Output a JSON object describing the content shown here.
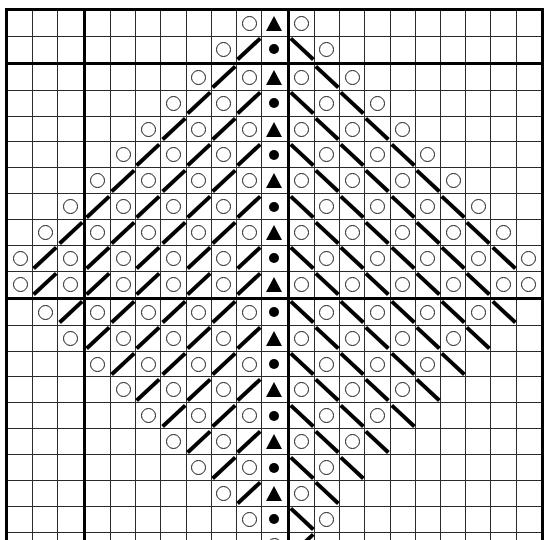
{
  "document": {
    "kind": "knitting-stitch-chart",
    "title": "Lace Chevron Stitch Chart",
    "rows": 21,
    "columns": 21,
    "colors": {
      "grid_line": "#2b2b2b",
      "heavy_grid_line": "#000000",
      "symbol": "#000000",
      "background": "#ffffff"
    },
    "heavy_column_boundaries": [
      3,
      11
    ],
    "heavy_row_boundaries": [
      2,
      11
    ],
    "symbol_key": {
      "O": "yarn-over-circle",
      "T": "centered-double-decrease-triangle",
      "D": "purl-dot",
      "R": "right-leaning-decrease-diagonal",
      "L": "left-leaning-decrease-diagonal",
      "-": "empty-cell"
    },
    "grid": [
      [
        "-",
        "-",
        "-",
        "-",
        "-",
        "-",
        "-",
        "-",
        "-",
        "O",
        "T",
        "O",
        "-",
        "-",
        "-",
        "-",
        "-",
        "-",
        "-",
        "-",
        "-"
      ],
      [
        "-",
        "-",
        "-",
        "-",
        "-",
        "-",
        "-",
        "-",
        "O",
        "R",
        "D",
        "L",
        "O",
        "-",
        "-",
        "-",
        "-",
        "-",
        "-",
        "-",
        "-"
      ],
      [
        "-",
        "-",
        "-",
        "-",
        "-",
        "-",
        "-",
        "O",
        "R",
        "O",
        "T",
        "O",
        "L",
        "O",
        "-",
        "-",
        "-",
        "-",
        "-",
        "-",
        "-"
      ],
      [
        "-",
        "-",
        "-",
        "-",
        "-",
        "-",
        "O",
        "R",
        "O",
        "R",
        "D",
        "L",
        "O",
        "L",
        "O",
        "-",
        "-",
        "-",
        "-",
        "-",
        "-"
      ],
      [
        "-",
        "-",
        "-",
        "-",
        "-",
        "O",
        "R",
        "O",
        "R",
        "O",
        "T",
        "O",
        "L",
        "O",
        "L",
        "O",
        "-",
        "-",
        "-",
        "-",
        "-"
      ],
      [
        "-",
        "-",
        "-",
        "-",
        "O",
        "R",
        "O",
        "R",
        "O",
        "R",
        "D",
        "L",
        "O",
        "L",
        "O",
        "L",
        "O",
        "-",
        "-",
        "-",
        "-"
      ],
      [
        "-",
        "-",
        "-",
        "O",
        "R",
        "O",
        "R",
        "O",
        "R",
        "O",
        "T",
        "O",
        "L",
        "O",
        "L",
        "O",
        "L",
        "O",
        "-",
        "-",
        "-"
      ],
      [
        "-",
        "-",
        "O",
        "R",
        "O",
        "R",
        "O",
        "R",
        "O",
        "R",
        "D",
        "L",
        "O",
        "L",
        "O",
        "L",
        "O",
        "L",
        "O",
        "-",
        "-"
      ],
      [
        "-",
        "O",
        "R",
        "O",
        "R",
        "O",
        "R",
        "O",
        "R",
        "O",
        "T",
        "O",
        "L",
        "O",
        "L",
        "O",
        "L",
        "O",
        "L",
        "O",
        "-"
      ],
      [
        "O",
        "R",
        "O",
        "R",
        "O",
        "R",
        "O",
        "R",
        "O",
        "R",
        "D",
        "L",
        "O",
        "L",
        "O",
        "L",
        "O",
        "L",
        "O",
        "L",
        "O"
      ],
      [
        "O",
        "R",
        "O",
        "R",
        "O",
        "R",
        "O",
        "R",
        "O",
        "R",
        "T",
        "O",
        "L",
        "O",
        "L",
        "O",
        "L",
        "O",
        "L",
        "O",
        "O"
      ],
      [
        "-",
        "O",
        "R",
        "O",
        "R",
        "O",
        "R",
        "O",
        "R",
        "O",
        "D",
        "L",
        "O",
        "L",
        "O",
        "L",
        "O",
        "L",
        "O",
        "L",
        "-"
      ],
      [
        "-",
        "-",
        "O",
        "R",
        "O",
        "R",
        "O",
        "R",
        "O",
        "R",
        "T",
        "O",
        "L",
        "O",
        "L",
        "O",
        "L",
        "O",
        "L",
        "-",
        "-"
      ],
      [
        "-",
        "-",
        "-",
        "O",
        "R",
        "O",
        "R",
        "O",
        "R",
        "O",
        "D",
        "L",
        "O",
        "L",
        "O",
        "L",
        "O",
        "L",
        "-",
        "-",
        "-"
      ],
      [
        "-",
        "-",
        "-",
        "-",
        "O",
        "R",
        "O",
        "R",
        "O",
        "R",
        "T",
        "O",
        "L",
        "O",
        "L",
        "O",
        "L",
        "-",
        "-",
        "-",
        "-"
      ],
      [
        "-",
        "-",
        "-",
        "-",
        "-",
        "O",
        "R",
        "O",
        "R",
        "O",
        "D",
        "L",
        "O",
        "L",
        "O",
        "L",
        "-",
        "-",
        "-",
        "-",
        "-"
      ],
      [
        "-",
        "-",
        "-",
        "-",
        "-",
        "-",
        "O",
        "R",
        "O",
        "R",
        "T",
        "O",
        "L",
        "O",
        "L",
        "-",
        "-",
        "-",
        "-",
        "-",
        "-"
      ],
      [
        "-",
        "-",
        "-",
        "-",
        "-",
        "-",
        "-",
        "O",
        "R",
        "O",
        "D",
        "L",
        "O",
        "L",
        "-",
        "-",
        "-",
        "-",
        "-",
        "-",
        "-"
      ],
      [
        "-",
        "-",
        "-",
        "-",
        "-",
        "-",
        "-",
        "-",
        "O",
        "R",
        "T",
        "O",
        "L",
        "-",
        "-",
        "-",
        "-",
        "-",
        "-",
        "-",
        "-"
      ],
      [
        "-",
        "-",
        "-",
        "-",
        "-",
        "-",
        "-",
        "-",
        "-",
        "O",
        "D",
        "L",
        "O",
        "-",
        "-",
        "-",
        "-",
        "-",
        "-",
        "-",
        "-"
      ],
      [
        "-",
        "-",
        "-",
        "-",
        "-",
        "-",
        "-",
        "-",
        "-",
        "-",
        "O",
        "R",
        "-",
        "-",
        "-",
        "-",
        "-",
        "-",
        "-",
        "-",
        "-"
      ]
    ]
  }
}
